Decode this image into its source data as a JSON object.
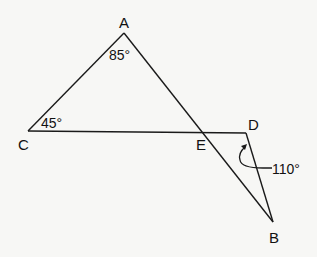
{
  "diagram": {
    "title": "",
    "colors": {
      "line": "#1a1a1a",
      "text": "#111111",
      "background": "#f7f7f5"
    },
    "points": {
      "A": {
        "label": "A",
        "x": 124,
        "y": 33
      },
      "B": {
        "label": "B",
        "x": 273,
        "y": 222
      },
      "C": {
        "label": "C",
        "x": 28,
        "y": 131
      },
      "D": {
        "label": "D",
        "x": 246,
        "y": 133
      },
      "E": {
        "label": "E",
        "x": 203,
        "y": 132
      }
    },
    "segments": [
      {
        "from": "C",
        "to": "A"
      },
      {
        "from": "A",
        "to": "B"
      },
      {
        "from": "C",
        "to": "D"
      },
      {
        "from": "D",
        "to": "B"
      }
    ],
    "angles": {
      "A": {
        "label": "85°"
      },
      "C": {
        "label": "45°"
      },
      "D": {
        "label": "110°"
      }
    }
  }
}
